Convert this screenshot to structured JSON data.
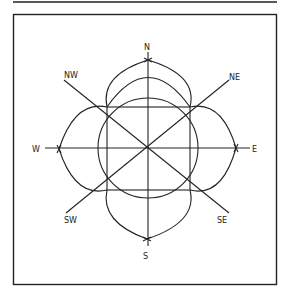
{
  "diagram": {
    "type": "compass-rose-construction",
    "colors": {
      "ink": "#222222",
      "background": "#ffffff"
    },
    "labels": {
      "n": "N",
      "ne": "NE",
      "e": "E",
      "se": "SE",
      "s": "S",
      "sw": "SW",
      "w": "W",
      "nw": "NW"
    }
  }
}
